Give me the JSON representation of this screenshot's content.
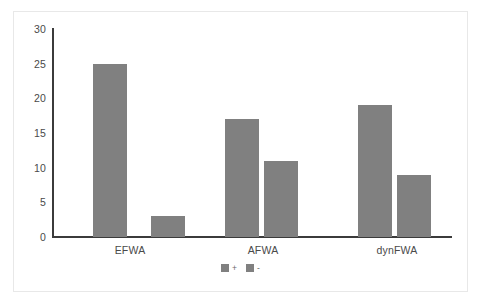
{
  "chart_data": {
    "type": "bar",
    "title": "",
    "subtitle": "",
    "xlabel": "",
    "ylabel": "",
    "categories": [
      "EFWA",
      "AFWA",
      "dynFWA"
    ],
    "series": [
      {
        "name": "+",
        "values": [
          25,
          17,
          19
        ],
        "color": "#808080"
      },
      {
        "name": "-",
        "values": [
          3,
          11,
          9
        ],
        "color": "#808080"
      }
    ],
    "ylim": [
      0,
      30
    ],
    "yticks": [
      0,
      5,
      10,
      15,
      20,
      25,
      30
    ],
    "ytick_labels": [
      "0",
      "5",
      "10",
      "15",
      "20",
      "25",
      "30"
    ],
    "grid": false,
    "legend_position": "bottom"
  },
  "style": {
    "bar_color": "#808080",
    "axis_color": "#3b3b3b",
    "tick_text_color": "#4a4a4a",
    "frame_color": "#e8e8e8",
    "background": "#ffffff"
  }
}
